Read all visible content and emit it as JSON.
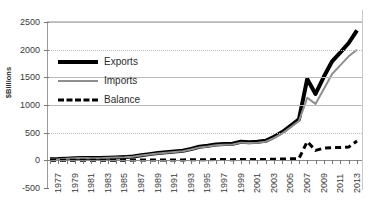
{
  "chart_data": {
    "type": "line",
    "title": "",
    "subtitle": "",
    "xlabel": "",
    "ylabel": "$Billions",
    "ylim": [
      -500,
      2500
    ],
    "yticks": [
      2500,
      2000,
      1500,
      1000,
      500,
      0,
      -500
    ],
    "ytick_labels": [
      "2500",
      "2000",
      "1500",
      "1000",
      "500",
      "0",
      "-500"
    ],
    "xlim": [
      1977,
      2014
    ],
    "xticks": [
      1977,
      1978,
      1979,
      1980,
      1981,
      1982,
      1983,
      1984,
      1985,
      1986,
      1987,
      1988,
      1989,
      1990,
      1991,
      1992,
      1993,
      1994,
      1995,
      1996,
      1997,
      1998,
      1999,
      2000,
      2001,
      2002,
      2003,
      2004,
      2005,
      2006,
      2007,
      2008,
      2009,
      2010,
      2011,
      2012,
      2013,
      2014
    ],
    "xtick_labels_shown": [
      "1977",
      "1979",
      "1981",
      "1983",
      "1985",
      "1987",
      "1989",
      "1991",
      "1993",
      "1995",
      "1997",
      "1999",
      "2001",
      "2003",
      "2005",
      "2007",
      "2009",
      "2011",
      "2013"
    ],
    "grid": true,
    "grid_axis": "y",
    "legend_position": "upper-left-inside",
    "x": [
      1977,
      1978,
      1979,
      1980,
      1981,
      1982,
      1983,
      1984,
      1985,
      1986,
      1987,
      1988,
      1989,
      1990,
      1991,
      1992,
      1993,
      1994,
      1995,
      1996,
      1997,
      1998,
      1999,
      2000,
      2001,
      2002,
      2003,
      2004,
      2005,
      2006,
      2007,
      2008,
      2009,
      2010,
      2011,
      2012,
      2013,
      2014
    ],
    "series": [
      {
        "name": "Exports",
        "color": "#000000",
        "style": "solid",
        "width": 4,
        "values": [
          10,
          14,
          20,
          25,
          28,
          26,
          25,
          30,
          32,
          35,
          42,
          55,
          68,
          80,
          88,
          95,
          105,
          125,
          150,
          160,
          175,
          180,
          185,
          205,
          200,
          205,
          215,
          260,
          310,
          380,
          450,
          600,
          520,
          690,
          830,
          900,
          930,
          960
        ]
      },
      {
        "name": "Imports",
        "color": "#8f8f8f",
        "style": "solid",
        "width": 2,
        "values": [
          10,
          14,
          20,
          26,
          30,
          28,
          28,
          34,
          36,
          40,
          48,
          60,
          72,
          82,
          90,
          98,
          110,
          128,
          150,
          158,
          172,
          176,
          180,
          200,
          198,
          202,
          212,
          250,
          295,
          360,
          430,
          560,
          480,
          640,
          780,
          850,
          880,
          900
        ]
      },
      {
        "name": "Balance",
        "color": "#000000",
        "style": "dashed",
        "width": 3,
        "values": [
          0,
          0,
          0,
          -1,
          -2,
          -2,
          -3,
          -4,
          -4,
          -5,
          -6,
          -5,
          -4,
          -2,
          -2,
          -3,
          -5,
          -3,
          0,
          2,
          3,
          4,
          5,
          5,
          2,
          3,
          3,
          10,
          15,
          20,
          20,
          40,
          40,
          50,
          50,
          60,
          50,
          60
        ]
      }
    ],
    "series_plot": [
      {
        "name": "Exports",
        "values": [
          18,
          22,
          30,
          38,
          42,
          40,
          40,
          48,
          52,
          58,
          70,
          92,
          112,
          132,
          145,
          158,
          172,
          205,
          245,
          262,
          285,
          295,
          300,
          335,
          328,
          335,
          352,
          425,
          510,
          625,
          740,
          1470,
          1200,
          1510,
          1790,
          1950,
          2120,
          2350
        ]
      },
      {
        "name": "Imports",
        "values": [
          16,
          20,
          28,
          36,
          40,
          38,
          38,
          45,
          49,
          55,
          66,
          86,
          105,
          124,
          137,
          150,
          164,
          195,
          234,
          250,
          272,
          282,
          288,
          320,
          314,
          320,
          336,
          405,
          487,
          598,
          710,
          1130,
          1020,
          1290,
          1560,
          1720,
          1880,
          2000
        ]
      },
      {
        "name": "Balance",
        "values": [
          2,
          2,
          2,
          2,
          2,
          2,
          2,
          3,
          3,
          3,
          4,
          6,
          7,
          8,
          8,
          8,
          8,
          10,
          11,
          12,
          13,
          13,
          12,
          15,
          14,
          15,
          16,
          20,
          23,
          27,
          30,
          340,
          180,
          220,
          230,
          230,
          240,
          350
        ]
      }
    ]
  },
  "legend": {
    "items": [
      {
        "label": "Exports"
      },
      {
        "label": "Imports"
      },
      {
        "label": "Balance"
      }
    ]
  }
}
